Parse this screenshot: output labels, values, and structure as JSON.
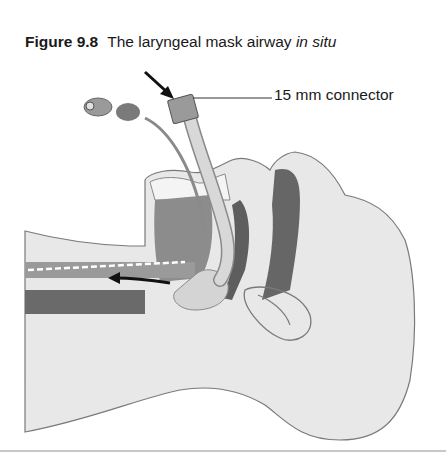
{
  "figure": {
    "number": "Figure 9.8",
    "title_plain": "The laryngeal mask airway ",
    "title_italic": "in situ",
    "labels": {
      "connector": "15 mm connector"
    }
  },
  "colors": {
    "skin": "#e6e6e6",
    "outline": "#7a7a7a",
    "dark_tissue": "#5e5e5e",
    "mid_tissue": "#8c8c8c",
    "tube": "#d2d2d2",
    "arrow": "#111111"
  }
}
